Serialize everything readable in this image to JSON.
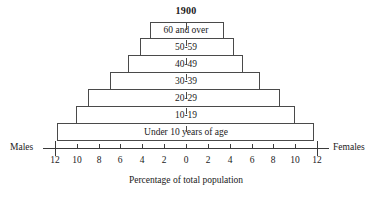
{
  "chart_data": {
    "type": "bar",
    "subtype": "population-pyramid",
    "title": "1900",
    "xlabel": "Percentage of total population",
    "ylabel": "",
    "categories": [
      "60 and over",
      "50-59",
      "40-49",
      "30-39",
      "20-29",
      "10-19",
      "Under 10 years of age"
    ],
    "series": [
      {
        "name": "Males",
        "side": "left",
        "values": [
          3.3,
          4.2,
          5.3,
          7.0,
          9.0,
          10.1,
          11.8
        ]
      },
      {
        "name": "Females",
        "side": "right",
        "values": [
          3.5,
          4.4,
          5.2,
          6.8,
          8.6,
          10.0,
          11.7
        ]
      }
    ],
    "xlim": [
      -12,
      12
    ],
    "xticks": [
      -12,
      -10,
      -8,
      -6,
      -4,
      -2,
      0,
      2,
      4,
      6,
      8,
      10,
      12
    ],
    "xtick_labels": [
      "12",
      "10",
      "8",
      "6",
      "4",
      "2",
      "0",
      "2",
      "4",
      "6",
      "8",
      "10",
      "12"
    ],
    "grid": false,
    "legend": "none",
    "left_axis_label": "Males",
    "right_axis_label": "Females"
  },
  "rows": [
    {
      "label": "60 and over",
      "left": 3.3,
      "right": 3.5
    },
    {
      "label": "50-59",
      "left": 4.2,
      "right": 4.4
    },
    {
      "label": "40-49",
      "left": 5.3,
      "right": 5.2
    },
    {
      "label": "30-39",
      "left": 7.0,
      "right": 6.8
    },
    {
      "label": "20-29",
      "left": 9.0,
      "right": 8.6
    },
    {
      "label": "10-19",
      "left": 10.1,
      "right": 10.0
    },
    {
      "label": "Under 10 years of age",
      "left": 11.8,
      "right": 11.7
    }
  ],
  "axis": {
    "tick_labels": [
      "12",
      "10",
      "8",
      "6",
      "4",
      "2",
      "0",
      "2",
      "4",
      "6",
      "8",
      "10",
      "12"
    ],
    "tick_values": [
      -12,
      -10,
      -8,
      -6,
      -4,
      -2,
      0,
      2,
      4,
      6,
      8,
      10,
      12
    ],
    "caption": "Percentage of total population",
    "left_label": "Males",
    "right_label": "Females"
  },
  "colors": {
    "line": "#4a4a4a",
    "axis": "#3a3a3a",
    "text": "#1a1a1a",
    "background": "#ffffff"
  }
}
